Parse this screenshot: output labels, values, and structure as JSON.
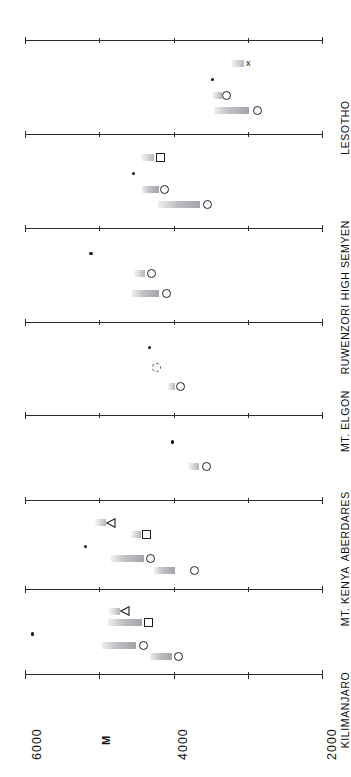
{
  "chart_data": {
    "type": "scatter",
    "title": "",
    "subtitle": "",
    "orientation": "rotated-90",
    "xlabel": "",
    "ylabel": "M",
    "ylim": [
      2000,
      6000
    ],
    "axis_ticks": [
      6000,
      5000,
      4000,
      3000,
      2000
    ],
    "axis_tick_labels": [
      "6000",
      "5000",
      "4000",
      "3000",
      "2000"
    ],
    "axis_labels_shown": [
      "6000",
      "4000",
      "2000"
    ],
    "grid": false,
    "legend": "none",
    "unit": "M",
    "panels": [
      {
        "name": "LESOTHO",
        "rows": [
          {
            "marker": "cross",
            "marker_value": 2970,
            "bar_from": 3230,
            "bar_to": 3050
          },
          {
            "marker": "dot",
            "marker_value": 3480,
            "bar_from": null,
            "bar_to": null
          },
          {
            "marker": "circle",
            "marker_value": 3290,
            "bar_from": 3480,
            "bar_to": 3350
          },
          {
            "marker": "circle",
            "marker_value": 2870,
            "bar_from": 3460,
            "bar_to": 2980
          }
        ]
      },
      {
        "name": "HIGH SEMYEN",
        "rows": [
          {
            "marker": "square",
            "marker_value": 4180,
            "bar_from": 4440,
            "bar_to": 4260
          },
          {
            "marker": "dot",
            "marker_value": 4540,
            "bar_from": null,
            "bar_to": null
          },
          {
            "marker": "circle",
            "marker_value": 4120,
            "bar_from": 4430,
            "bar_to": 4200
          },
          {
            "marker": "circle",
            "marker_value": 3540,
            "bar_from": 4210,
            "bar_to": 3640
          }
        ]
      },
      {
        "name": "RUWENZORI",
        "rows": [
          {
            "marker": "dot",
            "marker_value": 5110,
            "bar_from": null,
            "bar_to": null
          },
          {
            "marker": "circle",
            "marker_value": 4290,
            "bar_from": 4530,
            "bar_to": 4380
          },
          {
            "marker": "circle",
            "marker_value": 4100,
            "bar_from": 4560,
            "bar_to": 4190
          }
        ]
      },
      {
        "name": "MT. ELGON",
        "rows": [
          {
            "marker": "dot",
            "marker_value": 4320,
            "bar_from": null,
            "bar_to": null
          },
          {
            "marker": "circle-dashed",
            "marker_value": 4230,
            "bar_from": null,
            "bar_to": null
          },
          {
            "marker": "circle",
            "marker_value": 3900,
            "bar_from": 4080,
            "bar_to": 3980
          }
        ]
      },
      {
        "name": "ABERDARES",
        "rows": [
          {
            "marker": "dot",
            "marker_value": 4010,
            "bar_from": null,
            "bar_to": null
          },
          {
            "marker": "circle",
            "marker_value": 3550,
            "bar_from": 3800,
            "bar_to": 3650
          }
        ]
      },
      {
        "name": "MT. KENYA",
        "rows": [
          {
            "marker": "triangle",
            "marker_value": 4840,
            "bar_from": 5060,
            "bar_to": 4910
          },
          {
            "marker": "square",
            "marker_value": 4360,
            "bar_from": 4570,
            "bar_to": 4440
          },
          {
            "marker": "dot",
            "marker_value": 5190,
            "bar_from": null,
            "bar_to": null
          },
          {
            "marker": "circle",
            "marker_value": 4310,
            "bar_from": 4840,
            "bar_to": 4400
          },
          {
            "marker": "circle",
            "marker_value": 3720,
            "bar_from": 4260,
            "bar_to": 3980
          }
        ]
      },
      {
        "name": "KILIMANJARO",
        "rows": [
          {
            "marker": "triangle",
            "marker_value": 4650,
            "bar_from": 4870,
            "bar_to": 4720
          },
          {
            "marker": "square",
            "marker_value": 4340,
            "bar_from": 4880,
            "bar_to": 4430
          },
          {
            "marker": "dot",
            "marker_value": 5900,
            "bar_from": null,
            "bar_to": null
          },
          {
            "marker": "circle",
            "marker_value": 4410,
            "bar_from": 4960,
            "bar_to": 4500
          },
          {
            "marker": "circle",
            "marker_value": 3930,
            "bar_from": 4310,
            "bar_to": 4020
          }
        ]
      }
    ]
  },
  "axis": {
    "label_6000": "6000",
    "label_4000": "4000",
    "label_2000": "2000",
    "unit": "M"
  },
  "panel_names": {
    "p0": "LESOTHO",
    "p1": "HIGH SEMYEN",
    "p2": "RUWENZORI",
    "p3": "MT. ELGON",
    "p4": "ABERDARES",
    "p5": "MT. KENYA",
    "p6": "KILIMANJARO"
  }
}
